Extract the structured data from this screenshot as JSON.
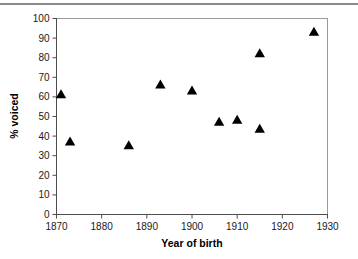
{
  "chart_data": {
    "type": "scatter",
    "title": "",
    "xlabel": "Year of birth",
    "ylabel": "% voiced",
    "xlim": [
      1870,
      1930
    ],
    "ylim": [
      0,
      100
    ],
    "xticks": [
      1870,
      1880,
      1890,
      1900,
      1910,
      1920,
      1930
    ],
    "xtick_labels": [
      "1870",
      "1880",
      "1890",
      "1900",
      "1910",
      "1920",
      "1930"
    ],
    "yticks": [
      0,
      10,
      20,
      30,
      40,
      50,
      60,
      70,
      80,
      90,
      100
    ],
    "ytick_labels": [
      "0",
      "10",
      "20",
      "30",
      "40",
      "50",
      "60",
      "70",
      "80",
      "90",
      "100"
    ],
    "grid": false,
    "legend": null,
    "marker": "triangle-up",
    "marker_color": "#000000",
    "series": [
      {
        "name": "speakers",
        "points": [
          {
            "x": 1871,
            "y": 61
          },
          {
            "x": 1873,
            "y": 37
          },
          {
            "x": 1886,
            "y": 35
          },
          {
            "x": 1893,
            "y": 66
          },
          {
            "x": 1900,
            "y": 63
          },
          {
            "x": 1906,
            "y": 47
          },
          {
            "x": 1910,
            "y": 48
          },
          {
            "x": 1915,
            "y": 43.5
          },
          {
            "x": 1915,
            "y": 82
          },
          {
            "x": 1927,
            "y": 93
          }
        ]
      }
    ]
  }
}
